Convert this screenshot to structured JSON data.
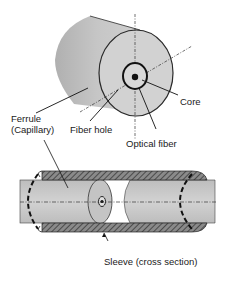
{
  "labels": {
    "ferrule_line1": "Ferrule",
    "ferrule_line2": "(Capillary)",
    "fiber_hole": "Fiber hole",
    "core": "Core",
    "optical_fiber": "Optical fiber",
    "sleeve": "Sleeve (cross section)"
  },
  "colors": {
    "ferrule_fill": "#c8c8c8",
    "face_fill": "#d4d4d4",
    "outline": "#2a2a2a",
    "sleeve_fill": "#6e6e6e"
  }
}
